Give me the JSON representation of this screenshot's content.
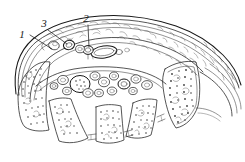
{
  "figure": {
    "title": "Histological cross-section line drawing",
    "background_color": "#ffffff",
    "ink_color": "#2b2b2b",
    "label_color": "#1a1a1a",
    "labels": [
      {
        "id": "label-1",
        "text": "1",
        "x": 24,
        "y": 38,
        "leader_from": [
          30,
          35
        ],
        "leader_to": [
          52,
          49
        ]
      },
      {
        "id": "label-3",
        "text": "3",
        "x": 45,
        "y": 27,
        "leader_from": [
          48,
          29
        ],
        "leader_to": [
          66,
          43
        ]
      },
      {
        "id": "label-2",
        "text": "2",
        "x": 85,
        "y": 22,
        "leader_from": [
          88,
          24
        ],
        "leader_to": [
          89,
          47
        ]
      }
    ],
    "regions": [
      {
        "name": "outer-capsule-band",
        "note": "Multi-layered curved band sweeping from lower-left around the top to the right, containing fine squiggle texture."
      },
      {
        "name": "upper-vessel-group",
        "note": "Cluster of elongated and round vessel outlines within the upper band, left of centre."
      },
      {
        "name": "central-cavity",
        "note": "Open space below the band containing scattered free round cells."
      },
      {
        "name": "lower-lobule-row",
        "note": "Row of four to five rounded lobules along the bottom, densely stippled."
      },
      {
        "name": "right-tail",
        "note": "Concentric curved lines tapering to the right edge."
      }
    ],
    "free_cells_count": 14,
    "lobule_count": 5
  }
}
